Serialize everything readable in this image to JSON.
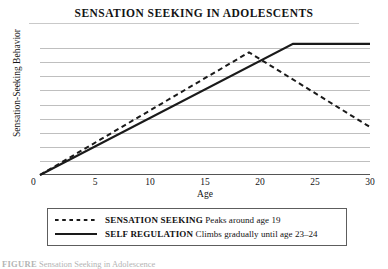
{
  "figure": {
    "title": "SENSATION SEEKING IN ADOLESCENTS",
    "caption_label": "FIGURE",
    "caption_text": "Sensation Seeking in Adolescence"
  },
  "axes": {
    "x_title": "Age",
    "y_title": "Sensation-Seeking Behavior",
    "origin_label": "0"
  },
  "legend": {
    "items": [
      {
        "name": "SENSATION SEEKING",
        "description": "Peaks around age 19",
        "style": "dashed",
        "color": "#1a1a1a"
      },
      {
        "name": "SELF REGULATION",
        "description": "Climbs gradually until age 23–24",
        "style": "solid",
        "color": "#1a1a1a"
      }
    ]
  },
  "chart_data": {
    "type": "line",
    "title": "SENSATION SEEKING IN ADOLESCENTS",
    "xlabel": "Age",
    "ylabel": "Sensation-Seeking Behavior",
    "xlim": [
      0,
      30
    ],
    "ylim": [
      0,
      10
    ],
    "xticks": [
      0,
      5,
      10,
      15,
      20,
      25,
      30
    ],
    "yticks": [
      0,
      1,
      2,
      3,
      4,
      5,
      6,
      7,
      8,
      9
    ],
    "ytick_labels": [],
    "grid": "horizontal",
    "legend_position": "below-axes",
    "series": [
      {
        "name": "SENSATION SEEKING",
        "style": "dashed",
        "color": "#1a1a1a",
        "annotation": "Peaks around age 19",
        "x": [
          0,
          19,
          30
        ],
        "y": [
          0,
          8.7,
          3.4
        ]
      },
      {
        "name": "SELF REGULATION",
        "style": "solid",
        "color": "#1a1a1a",
        "annotation": "Climbs gradually until age 23–24",
        "x": [
          0,
          23,
          30
        ],
        "y": [
          0,
          9.3,
          9.3
        ]
      }
    ]
  }
}
